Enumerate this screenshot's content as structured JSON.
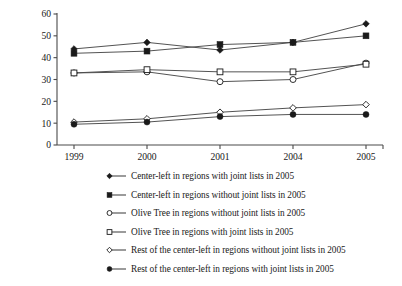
{
  "chart_data": {
    "type": "line",
    "title": "",
    "xlabel": "",
    "ylabel": "",
    "categories": [
      "1999",
      "2000",
      "2001",
      "2004",
      "2005"
    ],
    "ylim": [
      0,
      60
    ],
    "yticks": [
      0,
      10,
      20,
      30,
      40,
      50,
      60
    ],
    "grid": false,
    "legend_position": "below",
    "series": [
      {
        "name": "Center-left in regions with joint lists in 2005",
        "marker": "filled-diamond",
        "values": [
          44,
          47,
          43.5,
          47,
          55.5
        ]
      },
      {
        "name": "Center-left in regions without joint lists in 2005",
        "marker": "filled-square",
        "values": [
          42,
          43,
          46,
          47,
          50
        ]
      },
      {
        "name": "Olive Tree in regions without joint lists in 2005",
        "marker": "open-circle",
        "values": [
          33,
          33.5,
          29,
          30,
          37.5
        ]
      },
      {
        "name": "Olive Tree in regions with joint lists in 2005",
        "marker": "open-square",
        "values": [
          33,
          34.5,
          33.5,
          33.5,
          37
        ]
      },
      {
        "name": "Rest of the center-left in regions without joint lists in 2005",
        "marker": "open-diamond",
        "values": [
          10.5,
          12,
          15,
          17,
          18.5
        ]
      },
      {
        "name": "Rest of the center-left in regions with joint lists in 2005",
        "marker": "filled-circle",
        "values": [
          9.5,
          10.5,
          13,
          14,
          14
        ]
      }
    ]
  },
  "axis": {
    "y_tick_labels": [
      "0",
      "10",
      "20",
      "30",
      "40",
      "50",
      "60"
    ],
    "x_tick_labels": [
      "1999",
      "2000",
      "2001",
      "2004",
      "2005"
    ]
  },
  "legend": {
    "items": [
      {
        "marker": "filled-diamond",
        "label": "Center-left in regions with joint lists in 2005"
      },
      {
        "marker": "filled-square",
        "label": "Center-left in regions without joint lists in 2005"
      },
      {
        "marker": "open-circle",
        "label": "Olive Tree in regions without joint lists in 2005"
      },
      {
        "marker": "open-square",
        "label": "Olive Tree in regions with joint lists in 2005"
      },
      {
        "marker": "open-diamond",
        "label": "Rest of the center-left in regions without joint lists in 2005"
      },
      {
        "marker": "filled-circle",
        "label": "Rest of the center-left in regions with joint lists in 2005"
      }
    ]
  },
  "colors": {
    "ink": "#1a1a1a",
    "line": "#4a4a4a",
    "background": "#ffffff"
  }
}
